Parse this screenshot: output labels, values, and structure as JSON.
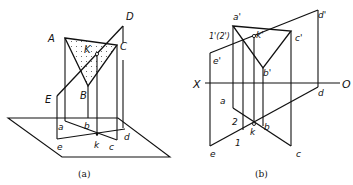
{
  "figure_a": {
    "caption": "(a)",
    "labels": {
      "A": "A",
      "B": "B",
      "C": "C",
      "D": "D",
      "E": "E",
      "K": "K",
      "a": "a",
      "b": "b",
      "c": "c",
      "d": "d",
      "e": "e",
      "k": "k"
    }
  },
  "figure_b": {
    "caption": "(b)",
    "labels": {
      "a_prime": "a'",
      "b_prime": "b'",
      "c_prime": "c'",
      "d_prime": "d'",
      "e_prime": "e'",
      "k_prime": "k'",
      "one_two_prime": "1'(2')",
      "X": "X",
      "O": "O",
      "a": "a",
      "b": "b",
      "c": "c",
      "d": "d",
      "e": "e",
      "k": "k",
      "one": "1",
      "two": "2"
    }
  },
  "colors": {
    "ink": "#111111",
    "background": "#ffffff",
    "dots": "#555555"
  }
}
